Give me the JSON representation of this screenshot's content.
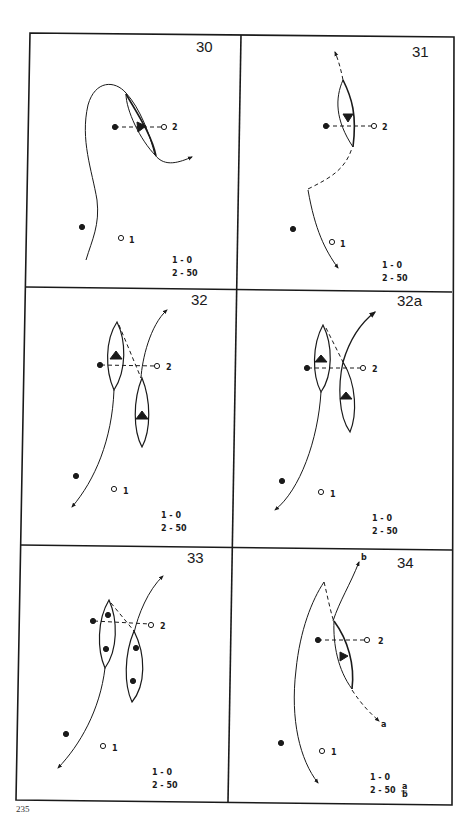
{
  "page_number": "235",
  "panels": [
    {
      "id": "30",
      "score": {
        "line1": "1 - 0",
        "line2": "2 - 50"
      },
      "mark1": "1",
      "mark2": "2"
    },
    {
      "id": "31",
      "score": {
        "line1": "1 - 0",
        "line2": "2 - 50"
      },
      "mark1": "1",
      "mark2": "2"
    },
    {
      "id": "32",
      "score": {
        "line1": "1 - 0",
        "line2": "2 - 50"
      },
      "mark1": "1",
      "mark2": "2"
    },
    {
      "id": "32a",
      "score": {
        "line1": "1 - 0",
        "line2": "2 - 50"
      },
      "mark1": "1",
      "mark2": "2"
    },
    {
      "id": "33",
      "score": {
        "line1": "1 - 0",
        "line2": "2 - 50"
      },
      "mark1": "1",
      "mark2": "2"
    },
    {
      "id": "34",
      "score": {
        "line1": "1 - 0",
        "line2": "2 - 50",
        "frac_top": "a",
        "frac_bottom": "b"
      },
      "mark1": "1",
      "mark2": "2",
      "end_a": "a",
      "end_b": "b"
    }
  ],
  "colors": {
    "ink": "#1a1a1a",
    "paper": "#ffffff"
  }
}
